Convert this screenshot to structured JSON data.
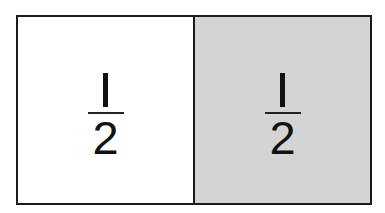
{
  "diagram": {
    "title": "",
    "colors": {
      "border": "#1a1a1a",
      "left_fill": "#ffffff",
      "right_fill": "#d4d4d4",
      "text": "#111111"
    },
    "cells": [
      {
        "numerator": "1",
        "denominator": "2",
        "shaded": false
      },
      {
        "numerator": "1",
        "denominator": "2",
        "shaded": true
      }
    ]
  }
}
